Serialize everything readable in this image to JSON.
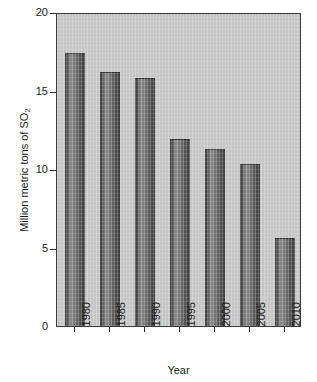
{
  "chart_data": {
    "type": "bar",
    "title": "",
    "subtitle": "",
    "xlabel": "Year",
    "ylabel": "Million metric tons of SO",
    "ylabel_sub": "2",
    "ylabel_full": "Million metric tons of SO2",
    "categories": [
      "1980",
      "1985",
      "1990",
      "1995",
      "2000",
      "2005",
      "2010"
    ],
    "values": [
      17.4,
      16.2,
      15.8,
      11.9,
      11.3,
      10.3,
      5.6
    ],
    "ylim": [
      0,
      20
    ],
    "yticks": [
      0,
      5,
      10,
      15,
      20
    ],
    "ytick_labels": [
      "0",
      "5",
      "10",
      "15",
      "20"
    ],
    "grid": false,
    "legend": null,
    "legend_position": "none",
    "series": [
      {
        "name": "SO2 emissions",
        "values": [
          17.4,
          16.2,
          15.8,
          11.9,
          11.3,
          10.3,
          5.6
        ]
      }
    ],
    "colors": {
      "plot_background": "#c9c9c9",
      "figure_background": "#ffffff",
      "bar_fill_dark": "#3d3d3d",
      "bar_fill_light": "#8e8e8e",
      "axis": "#3a3a3a",
      "text": "#1a1a1a"
    }
  }
}
